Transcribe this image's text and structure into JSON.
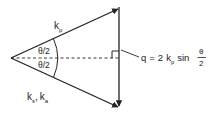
{
  "diagram": {
    "type": "vector-scattering-triangle",
    "colors": {
      "stroke": "#222222",
      "background": "#ffffff"
    },
    "vectors": {
      "upper": {
        "symbol": "k",
        "subscript": "p"
      },
      "lower": {
        "first": {
          "symbol": "k",
          "subscript": "s"
        },
        "separator": ",",
        "second": {
          "symbol": "k",
          "subscript": "a"
        }
      }
    },
    "angles": {
      "upper": "θ/2",
      "lower": "θ/2"
    },
    "formula": {
      "lhs": "q",
      "equals": "=",
      "coefficient": "2",
      "symbol": "k",
      "subscript": "p",
      "function": "sin",
      "fraction_numerator": "θ",
      "fraction_denominator": "2"
    }
  }
}
